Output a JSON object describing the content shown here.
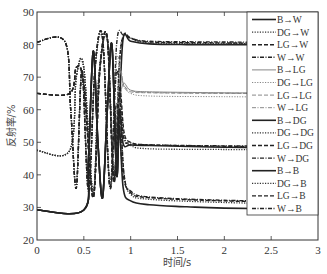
{
  "chart_data": {
    "type": "line",
    "title": "",
    "xlabel": "时间/s",
    "ylabel": "反射率/%",
    "xlim": [
      0,
      3
    ],
    "ylim": [
      20,
      90
    ],
    "xticks": [
      0,
      0.5,
      1,
      1.5,
      2,
      2.5,
      3
    ],
    "xtick_labels": [
      "0",
      "0.5",
      "1",
      "1.5",
      "2",
      "2.5",
      "3"
    ],
    "yticks": [
      20,
      30,
      40,
      50,
      60,
      70,
      80,
      90
    ],
    "ytick_labels": [
      "20",
      "30",
      "40",
      "50",
      "60",
      "70",
      "80",
      "90"
    ],
    "grid": false,
    "legend_position": "upper right",
    "series": [
      {
        "name": "B→W",
        "style": "solid",
        "width": 1.6,
        "color": "#222222",
        "x": [
          0,
          0.5,
          0.55,
          0.6,
          0.65,
          0.7,
          0.75,
          0.8,
          0.85,
          0.88,
          0.92,
          1.0,
          1.2,
          1.6,
          2.0,
          3.0
        ],
        "y": [
          29.2,
          29.2,
          45,
          78,
          50,
          33,
          60,
          80,
          40,
          60,
          82,
          81,
          80.2,
          80,
          80,
          80
        ]
      },
      {
        "name": "DG→W",
        "style": "dotted",
        "width": 1.3,
        "color": "#333333",
        "x": [
          0,
          0.35,
          0.42,
          0.5,
          0.6,
          0.66,
          0.75,
          0.82,
          0.88,
          0.93,
          1.0,
          1.2,
          2.0,
          3.0
        ],
        "y": [
          47.5,
          47.5,
          70,
          73,
          34,
          70,
          82,
          40,
          75,
          83,
          82,
          80.5,
          80.3,
          80.2
        ]
      },
      {
        "name": "LG→W",
        "style": "dashed",
        "width": 1.4,
        "color": "#222222",
        "x": [
          0,
          0.35,
          0.42,
          0.5,
          0.6,
          0.67,
          0.75,
          0.82,
          0.88,
          0.93,
          1.0,
          1.2,
          2.0,
          3.0
        ],
        "y": [
          65,
          65,
          73,
          68,
          33,
          72,
          82,
          38,
          74,
          83,
          82,
          80.8,
          80.5,
          80.3
        ]
      },
      {
        "name": "W→W",
        "style": "dashdot",
        "width": 1.4,
        "color": "#222222",
        "x": [
          0,
          0.3,
          0.36,
          0.42,
          0.48,
          0.55,
          0.62,
          0.7,
          0.78,
          0.85,
          0.92,
          1.0,
          1.2,
          2.0,
          3.0
        ],
        "y": [
          80.8,
          80.8,
          60,
          36,
          72,
          35,
          73,
          82,
          36,
          80,
          83,
          82,
          81,
          80.8,
          80.6
        ]
      },
      {
        "name": "B→LG",
        "style": "solid",
        "width": 1.0,
        "color": "#888888",
        "x": [
          0,
          0.5,
          0.55,
          0.6,
          0.65,
          0.7,
          0.75,
          0.8,
          0.85,
          0.88,
          0.92,
          1.0,
          1.2,
          2.0,
          3.0
        ],
        "y": [
          29.2,
          29.2,
          45,
          77,
          50,
          34,
          60,
          80,
          40,
          60,
          68,
          66,
          65.5,
          65.2,
          65
        ]
      },
      {
        "name": "DG→LG",
        "style": "dotted",
        "width": 1.0,
        "color": "#888888",
        "x": [
          0,
          0.35,
          0.42,
          0.5,
          0.6,
          0.66,
          0.75,
          0.82,
          0.88,
          0.93,
          1.0,
          1.2,
          2.0,
          3.0
        ],
        "y": [
          47.5,
          47.5,
          70,
          72,
          35,
          70,
          81,
          40,
          70,
          67,
          65,
          64.2,
          64,
          63.8
        ]
      },
      {
        "name": "LG→LG",
        "style": "dashed",
        "width": 1.0,
        "color": "#888888",
        "x": [
          0,
          0.35,
          0.42,
          0.5,
          0.6,
          0.67,
          0.75,
          0.82,
          0.88,
          0.93,
          1.0,
          1.2,
          2.0,
          3.0
        ],
        "y": [
          65,
          65,
          73,
          67,
          34,
          71,
          81,
          39,
          71,
          67,
          65.5,
          65.2,
          65,
          64.9
        ]
      },
      {
        "name": "W→LG",
        "style": "dashdot",
        "width": 1.0,
        "color": "#888888",
        "x": [
          0,
          0.3,
          0.36,
          0.42,
          0.48,
          0.55,
          0.62,
          0.7,
          0.78,
          0.85,
          0.92,
          1.0,
          1.2,
          2.0,
          3.0
        ],
        "y": [
          80.8,
          80.8,
          60,
          37,
          72,
          36,
          72,
          81,
          37,
          75,
          68,
          66,
          65.3,
          65.1,
          65
        ]
      },
      {
        "name": "B→DG",
        "style": "solid",
        "width": 1.6,
        "color": "#222222",
        "x": [
          0,
          0.5,
          0.55,
          0.6,
          0.65,
          0.7,
          0.75,
          0.8,
          0.85,
          0.88,
          0.92,
          1.0,
          1.2,
          2.0,
          3.0
        ],
        "y": [
          29.2,
          29.2,
          45,
          78,
          50,
          33,
          60,
          80,
          40,
          60,
          49.5,
          49.2,
          49,
          48.5,
          48.2
        ]
      },
      {
        "name": "DG→DG",
        "style": "dotted",
        "width": 1.3,
        "color": "#333333",
        "x": [
          0,
          0.35,
          0.42,
          0.5,
          0.6,
          0.66,
          0.75,
          0.82,
          0.88,
          0.93,
          1.0,
          1.2,
          2.0,
          3.0
        ],
        "y": [
          47.5,
          47.5,
          70,
          73,
          34,
          70,
          82,
          40,
          65,
          52,
          49,
          48,
          47.8,
          47.6
        ]
      },
      {
        "name": "LG→DG",
        "style": "dashed",
        "width": 1.4,
        "color": "#222222",
        "x": [
          0,
          0.35,
          0.42,
          0.5,
          0.6,
          0.67,
          0.75,
          0.82,
          0.88,
          0.93,
          1.0,
          1.2,
          2.0,
          3.0
        ],
        "y": [
          65,
          65,
          73,
          68,
          33,
          72,
          82,
          38,
          66,
          53,
          50,
          49.2,
          48.8,
          48.6
        ]
      },
      {
        "name": "W→DG",
        "style": "dashdot",
        "width": 1.4,
        "color": "#222222",
        "x": [
          0,
          0.3,
          0.36,
          0.42,
          0.48,
          0.55,
          0.62,
          0.7,
          0.78,
          0.85,
          0.92,
          1.0,
          1.2,
          2.0,
          3.0
        ],
        "y": [
          80.8,
          80.8,
          60,
          36,
          72,
          35,
          73,
          82,
          36,
          72,
          52,
          49.8,
          49.2,
          48.9,
          48.7
        ]
      },
      {
        "name": "B→B",
        "style": "solid",
        "width": 1.6,
        "color": "#222222",
        "x": [
          0,
          0.5,
          0.55,
          0.6,
          0.65,
          0.7,
          0.75,
          0.8,
          0.85,
          0.88,
          0.92,
          1.0,
          1.2,
          1.6,
          2.0,
          3.0
        ],
        "y": [
          29.2,
          29.2,
          45,
          78,
          50,
          33,
          60,
          80,
          40,
          55,
          36,
          32,
          30.8,
          30.2,
          29.8,
          29.4
        ]
      },
      {
        "name": "DG→B",
        "style": "dotted",
        "width": 1.3,
        "color": "#333333",
        "x": [
          0,
          0.35,
          0.42,
          0.5,
          0.6,
          0.66,
          0.75,
          0.82,
          0.88,
          0.93,
          1.0,
          1.2,
          2.0,
          3.0
        ],
        "y": [
          47.5,
          47.5,
          70,
          73,
          34,
          70,
          82,
          40,
          60,
          40,
          34,
          32.5,
          31.5,
          31
        ]
      },
      {
        "name": "LG→B",
        "style": "dashed",
        "width": 1.4,
        "color": "#222222",
        "x": [
          0,
          0.35,
          0.42,
          0.5,
          0.6,
          0.67,
          0.75,
          0.82,
          0.88,
          0.93,
          1.0,
          1.2,
          2.0,
          3.0
        ],
        "y": [
          65,
          65,
          73,
          68,
          33,
          72,
          82,
          38,
          60,
          40,
          34.5,
          33,
          32,
          31.5
        ]
      },
      {
        "name": "W→B",
        "style": "dashdot",
        "width": 1.4,
        "color": "#222222",
        "x": [
          0,
          0.3,
          0.36,
          0.42,
          0.48,
          0.55,
          0.62,
          0.7,
          0.78,
          0.85,
          0.92,
          1.0,
          1.2,
          2.0,
          3.0
        ],
        "y": [
          80.8,
          80.8,
          60,
          36,
          72,
          35,
          73,
          82,
          36,
          62,
          40,
          35,
          33.2,
          32.2,
          31.8
        ]
      }
    ]
  },
  "axes": {
    "xlabel": "时间/s",
    "ylabel": "反射率/%"
  },
  "legend": {
    "entries": [
      "B→W",
      "DG→W",
      "LG→W",
      "W→W",
      "B→LG",
      "DG→LG",
      "LG→LG",
      "W→LG",
      "B→DG",
      "DG→DG",
      "LG→DG",
      "W→DG",
      "B→B",
      "DG→B",
      "LG→B",
      "W→B"
    ]
  }
}
